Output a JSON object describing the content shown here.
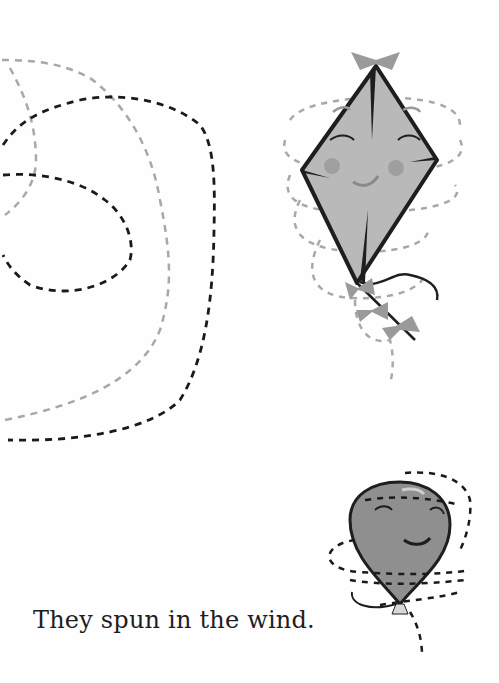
{
  "page": {
    "caption": "They spun in the wind.",
    "illustrations": [
      {
        "name": "kite",
        "description": "smiling diamond kite with closed eyes, rosy cheeks, bow tail"
      },
      {
        "name": "balloon",
        "description": "smiling balloon with squinted eyes and string"
      }
    ],
    "paths": [
      "dashed tracing loop (black)",
      "dashed tracing loop (gray)"
    ]
  },
  "colors": {
    "background": "#fefefe",
    "ink": "#1e1e1e",
    "kite_fill": "#b9b9b9",
    "kite_bow": "#9a9a9a",
    "cheek": "#9f9f9f",
    "balloon_fill": "#8f8f8f",
    "dash_black": "#1a1a1a",
    "dash_gray": "#a8a8a8"
  }
}
